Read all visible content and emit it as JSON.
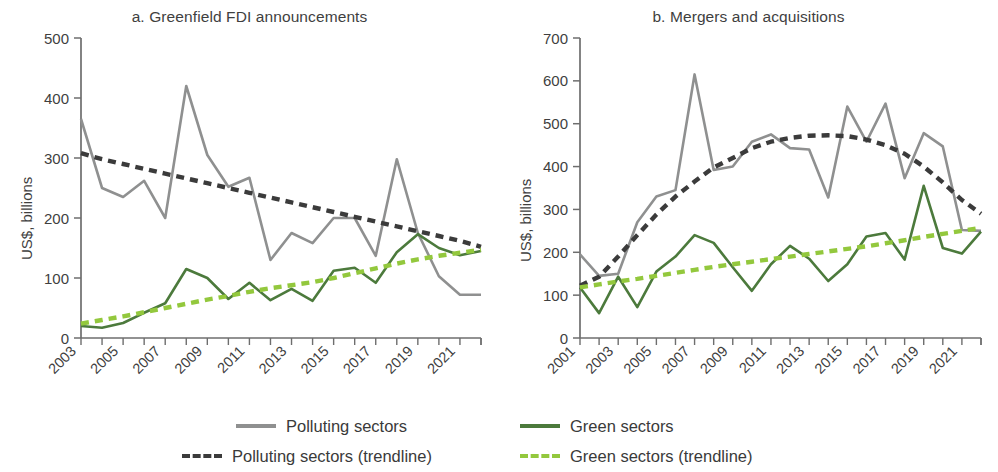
{
  "figure": {
    "width": 998,
    "height": 472
  },
  "colors": {
    "polluting": "#8f9090",
    "polluting_trend": "#3b3b3b",
    "green": "#4c7a3c",
    "green_trend": "#93c83d",
    "axis": "#6e6e6e",
    "text": "#3f3f3f"
  },
  "legend": {
    "items": [
      {
        "label": "Polluting sectors",
        "style": "solid",
        "color_key": "polluting"
      },
      {
        "label": "Green sectors",
        "style": "solid",
        "color_key": "green"
      },
      {
        "label": "Polluting sectors (trendline)",
        "style": "dashed",
        "color_key": "polluting_trend"
      },
      {
        "label": "Green sectors (trendline)",
        "style": "dashed",
        "color_key": "green_trend"
      }
    ]
  },
  "chart_data": [
    {
      "id": "panel-a",
      "type": "line",
      "title": "a. Greenfield FDI announcements",
      "xlabel": "",
      "ylabel": "US$, billions",
      "ylim": [
        0,
        500
      ],
      "yticks": [
        0,
        100,
        200,
        300,
        400,
        500
      ],
      "ytick_labels": [
        "0",
        "100",
        "200",
        "300",
        "400",
        "500"
      ],
      "xlim": [
        2003,
        2022
      ],
      "xticks": [
        2003,
        2005,
        2007,
        2009,
        2011,
        2013,
        2015,
        2017,
        2019,
        2021
      ],
      "xtick_labels": [
        "2003",
        "2005",
        "2007",
        "2009",
        "2011",
        "2013",
        "2015",
        "2017",
        "2019",
        "2021"
      ],
      "x": [
        2003,
        2004,
        2005,
        2006,
        2007,
        2008,
        2009,
        2010,
        2011,
        2012,
        2013,
        2014,
        2015,
        2016,
        2017,
        2018,
        2019,
        2020,
        2021,
        2022
      ],
      "grid": false,
      "legend_position": "below-figure",
      "series": [
        {
          "name": "Polluting sectors",
          "style": "solid",
          "color_key": "polluting",
          "values": [
            365,
            250,
            235,
            262,
            200,
            420,
            305,
            252,
            267,
            130,
            175,
            158,
            200,
            200,
            137,
            298,
            175,
            103,
            72,
            72
          ]
        },
        {
          "name": "Green sectors",
          "style": "solid",
          "color_key": "green",
          "values": [
            20,
            17,
            25,
            42,
            58,
            115,
            100,
            65,
            92,
            63,
            82,
            62,
            112,
            117,
            92,
            143,
            173,
            150,
            138,
            145
          ]
        },
        {
          "name": "Polluting sectors (trendline)",
          "style": "dashed",
          "color_key": "polluting_trend",
          "values": [
            308,
            298,
            290,
            282,
            274,
            266,
            258,
            250,
            242,
            234,
            226,
            218,
            210,
            202,
            194,
            186,
            178,
            170,
            162,
            152
          ]
        },
        {
          "name": "Green sectors (trendline)",
          "style": "dashed",
          "color_key": "green_trend",
          "values": [
            24,
            30,
            36,
            43,
            50,
            57,
            64,
            70,
            77,
            83,
            88,
            93,
            100,
            108,
            116,
            124,
            131,
            137,
            142,
            147
          ]
        }
      ]
    },
    {
      "id": "panel-b",
      "type": "line",
      "title": "b. Mergers and acquisitions",
      "xlabel": "",
      "ylabel": "US$, billions",
      "ylim": [
        0,
        700
      ],
      "yticks": [
        0,
        100,
        200,
        300,
        400,
        500,
        600,
        700
      ],
      "ytick_labels": [
        "0",
        "100",
        "200",
        "300",
        "400",
        "500",
        "600",
        "700"
      ],
      "xlim": [
        2001,
        2022
      ],
      "xticks": [
        2001,
        2003,
        2005,
        2007,
        2009,
        2011,
        2013,
        2015,
        2017,
        2019,
        2021
      ],
      "xtick_labels": [
        "2001",
        "2003",
        "2005",
        "2007",
        "2009",
        "2011",
        "2013",
        "2015",
        "2017",
        "2019",
        "2021"
      ],
      "x": [
        2001,
        2002,
        2003,
        2004,
        2005,
        2006,
        2007,
        2008,
        2009,
        2010,
        2011,
        2012,
        2013,
        2014,
        2015,
        2016,
        2017,
        2018,
        2019,
        2020,
        2021,
        2022
      ],
      "grid": false,
      "legend_position": "below-figure",
      "series": [
        {
          "name": "Polluting sectors",
          "style": "solid",
          "color_key": "polluting",
          "values": [
            195,
            145,
            150,
            270,
            330,
            345,
            615,
            392,
            400,
            458,
            475,
            443,
            440,
            328,
            540,
            458,
            547,
            373,
            478,
            447,
            252,
            250
          ]
        },
        {
          "name": "Green sectors",
          "style": "solid",
          "color_key": "green",
          "values": [
            118,
            58,
            143,
            72,
            155,
            190,
            240,
            222,
            165,
            110,
            172,
            215,
            185,
            133,
            172,
            237,
            245,
            183,
            355,
            210,
            197,
            248
          ]
        },
        {
          "name": "Polluting sectors (trendline)",
          "style": "dashed",
          "color_key": "polluting_trend",
          "values": [
            122,
            143,
            190,
            240,
            288,
            330,
            365,
            398,
            420,
            443,
            458,
            467,
            472,
            473,
            471,
            463,
            450,
            430,
            400,
            363,
            322,
            290
          ]
        },
        {
          "name": "Green sectors (trendline)",
          "style": "dashed",
          "color_key": "green_trend",
          "values": [
            118,
            125,
            132,
            138,
            145,
            152,
            159,
            166,
            172,
            178,
            184,
            190,
            196,
            202,
            208,
            214,
            221,
            228,
            236,
            243,
            250,
            257
          ]
        }
      ]
    }
  ]
}
